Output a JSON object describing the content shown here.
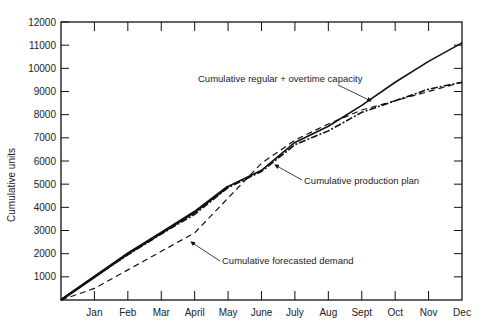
{
  "chart_data": {
    "type": "line",
    "title": "",
    "xlabel": "",
    "ylabel": "Cumulative units",
    "ylim": [
      0,
      12000
    ],
    "yticks": [
      1000,
      2000,
      3000,
      4000,
      5000,
      6000,
      7000,
      8000,
      9000,
      10000,
      11000,
      12000
    ],
    "grid": false,
    "legend": "inline annotations with arrows",
    "categories": [
      "Jan",
      "Feb",
      "Mar",
      "April",
      "May",
      "June",
      "July",
      "Aug",
      "Sept",
      "Oct",
      "Nov",
      "Dec"
    ],
    "series": [
      {
        "name": "Cumulative regular + overtime capacity",
        "style": "solid",
        "values": [
          1000,
          2000,
          2900,
          3800,
          4900,
          5600,
          6800,
          7500,
          8400,
          9400,
          10300,
          11100
        ]
      },
      {
        "name": "Cumulative production plan",
        "style": "dash-dot",
        "values": [
          1000,
          1950,
          2850,
          3700,
          4850,
          5550,
          6700,
          7300,
          8100,
          8600,
          9100,
          9400
        ]
      },
      {
        "name": "Cumulative forecasted demand",
        "style": "dashed",
        "values": [
          500,
          1300,
          2100,
          2900,
          4400,
          5900,
          6900,
          7600,
          8200,
          8600,
          9000,
          9400
        ]
      }
    ],
    "annotations": [
      {
        "text": "Cumulative regular + overtime capacity",
        "points_to": "Sept capacity line"
      },
      {
        "text": "Cumulative production plan",
        "points_to": "July production plan line"
      },
      {
        "text": "Cumulative forecasted demand",
        "points_to": "April forecasted demand line"
      }
    ]
  }
}
